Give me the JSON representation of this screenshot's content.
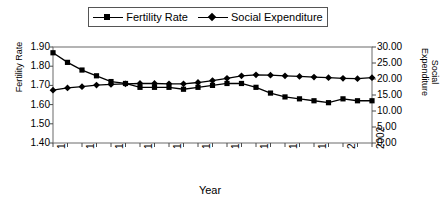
{
  "chart_data": {
    "type": "line",
    "title": "",
    "xlabel": "Year",
    "ylabel": "Fertility Rate",
    "y2label": "Social Expenditure",
    "grid": false,
    "legend_position": "top-center",
    "x": [
      1980,
      1981,
      1982,
      1983,
      1984,
      1985,
      1986,
      1987,
      1988,
      1989,
      1990,
      1991,
      1992,
      1993,
      1994,
      1995,
      1996,
      1997,
      1998,
      1999,
      2000,
      2001,
      2002
    ],
    "xlim": [
      1980,
      2002
    ],
    "xticks": [
      1980,
      1982,
      1984,
      1986,
      1988,
      1990,
      1992,
      1994,
      1996,
      1998,
      2000,
      2002
    ],
    "xtick_labels": [
      "1980",
      "1982",
      "1984",
      "1986",
      "1988",
      "1990",
      "1992",
      "1994",
      "1996",
      "1998",
      "2000",
      "2002"
    ],
    "ylim": [
      1.4,
      1.9
    ],
    "yticks": [
      1.4,
      1.5,
      1.6,
      1.7,
      1.8,
      1.9
    ],
    "ytick_labels": [
      "1.40",
      "1.50",
      "1.60",
      "1.70",
      "1.80",
      "1.90"
    ],
    "y2lim": [
      0.0,
      30.0
    ],
    "y2ticks": [
      0.0,
      5.0,
      10.0,
      15.0,
      20.0,
      25.0,
      30.0
    ],
    "y2tick_labels": [
      "0.00",
      "5.00",
      "10.00",
      "15.00",
      "20.00",
      "25.00",
      "30.00"
    ],
    "series": [
      {
        "name": "Fertility Rate",
        "axis": "left",
        "marker": "square",
        "color": "#000000",
        "values": [
          1.87,
          1.82,
          1.78,
          1.75,
          1.72,
          1.71,
          1.69,
          1.69,
          1.69,
          1.68,
          1.69,
          1.7,
          1.71,
          1.71,
          1.69,
          1.66,
          1.64,
          1.63,
          1.62,
          1.61,
          1.63,
          1.62,
          1.62
        ]
      },
      {
        "name": "Social Expenditure",
        "axis": "right",
        "marker": "diamond",
        "color": "#000000",
        "values": [
          16.5,
          17.2,
          17.6,
          18.1,
          18.3,
          18.5,
          18.6,
          18.6,
          18.5,
          18.5,
          18.9,
          19.5,
          20.2,
          21.0,
          21.3,
          21.2,
          21.0,
          20.8,
          20.6,
          20.4,
          20.2,
          20.1,
          20.4
        ]
      }
    ]
  },
  "legend": {
    "entries": [
      {
        "label": "Fertility Rate",
        "marker": "square"
      },
      {
        "label": "Social Expenditure",
        "marker": "diamond"
      }
    ]
  },
  "axes": {
    "left_title": "Fertility Rate",
    "right_title_line1": "Social",
    "right_title_line2": "Expenditure",
    "x_title": "Year"
  }
}
